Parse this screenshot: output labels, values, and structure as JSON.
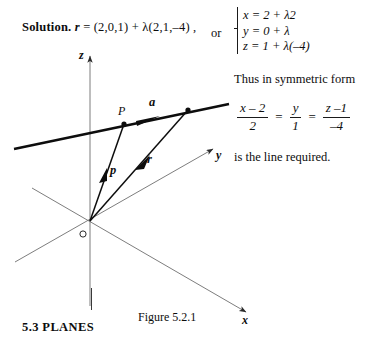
{
  "page": {
    "width": 373,
    "height": 350,
    "background": "#ffffff",
    "ink": "#0d0d0d"
  },
  "solution": {
    "label": "Solution.",
    "vector_symbol": "r",
    "equation": "= (2,0,1)  +  λ(2,1,–4) ,",
    "or_word": "or"
  },
  "parametric": {
    "lines": [
      "x  =  2  +  λ2",
      "y  =  0  +  λ",
      "z  =  1  +  λ(–4)"
    ]
  },
  "symmetric": {
    "intro": "Thus in symmetric form",
    "fractions": [
      {
        "num": "x – 2",
        "den": "2"
      },
      {
        "num": "y",
        "den": "1"
      },
      {
        "num": "z –1",
        "den": "–4"
      }
    ],
    "equals": "=",
    "conclusion": "is the line required."
  },
  "footer": {
    "section": "5.3  PLANES",
    "figure_caption": "Figure 5.2.1"
  },
  "diagram": {
    "axes": [
      {
        "name": "z-axis",
        "label": "z"
      },
      {
        "name": "y-axis",
        "label": "y"
      },
      {
        "name": "x-axis",
        "label": "x"
      }
    ],
    "origin_label": "O",
    "point_label": "P",
    "vectors": [
      {
        "name": "direction-vector-a",
        "label": "a"
      },
      {
        "name": "position-vector-p",
        "label": "p"
      },
      {
        "name": "position-vector-r",
        "label": "r"
      }
    ],
    "colors": {
      "axis_line": "#6e6e6e",
      "thick_line": "#0d0d0d",
      "vector": "#0d0d0d"
    }
  }
}
